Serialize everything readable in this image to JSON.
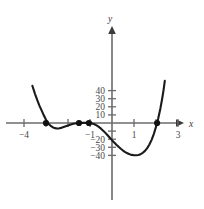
{
  "chart_data": {
    "type": "line",
    "title": "",
    "subtitle": "",
    "xlabel": "x",
    "ylabel": "y",
    "xlim": [
      -4.7,
      3.6
    ],
    "ylim": [
      -44,
      46
    ],
    "grid": false,
    "legend": null,
    "x_ticks": [
      {
        "value": -4,
        "label": "−4"
      },
      {
        "value": -3,
        "label": ""
      },
      {
        "value": -2,
        "label": ""
      },
      {
        "value": -1,
        "label": "−1"
      },
      {
        "value": 1,
        "label": "1"
      },
      {
        "value": 2,
        "label": ""
      },
      {
        "value": 3,
        "label": "3"
      }
    ],
    "y_ticks": [
      {
        "value": 40,
        "label": "40"
      },
      {
        "value": 30,
        "label": "30"
      },
      {
        "value": 20,
        "label": "20"
      },
      {
        "value": 10,
        "label": "10"
      },
      {
        "value": -10,
        "label": ""
      },
      {
        "value": -20,
        "label": "−20"
      },
      {
        "value": -30,
        "label": "−30"
      },
      {
        "value": -40,
        "label": "−40"
      }
    ],
    "series": [
      {
        "name": "quartic",
        "points": [
          [
            -3.62,
            46.0
          ],
          [
            -3.5,
            36.0
          ],
          [
            -3.4,
            28.5
          ],
          [
            -3.3,
            21.5
          ],
          [
            -3.2,
            15.5
          ],
          [
            -3.1,
            9.5
          ],
          [
            -3.0,
            4.0
          ],
          [
            -2.9,
            -0.5
          ],
          [
            -2.8,
            -3.2
          ],
          [
            -2.7,
            -5.2
          ],
          [
            -2.6,
            -6.3
          ],
          [
            -2.5,
            -6.8
          ],
          [
            -2.4,
            -6.6
          ],
          [
            -2.3,
            -6.0
          ],
          [
            -2.2,
            -5.0
          ],
          [
            -2.1,
            -4.0
          ],
          [
            -2.0,
            -3.0
          ],
          [
            -1.9,
            -2.1
          ],
          [
            -1.8,
            -1.3
          ],
          [
            -1.7,
            -0.7
          ],
          [
            -1.6,
            -0.2
          ],
          [
            -1.5,
            0.0
          ],
          [
            -1.4,
            0.1
          ],
          [
            -1.3,
            0.2
          ],
          [
            -1.2,
            0.1
          ],
          [
            -1.1,
            0.05
          ],
          [
            -1.0,
            0.0
          ],
          [
            -0.9,
            -0.6
          ],
          [
            -0.8,
            -1.6
          ],
          [
            -0.7,
            -3.0
          ],
          [
            -0.6,
            -4.8
          ],
          [
            -0.5,
            -7.0
          ],
          [
            -0.4,
            -9.5
          ],
          [
            -0.3,
            -12.2
          ],
          [
            -0.2,
            -15.2
          ],
          [
            -0.1,
            -18.2
          ],
          [
            0.0,
            -21.2
          ],
          [
            0.1,
            -24.0
          ],
          [
            0.2,
            -26.8
          ],
          [
            0.3,
            -29.4
          ],
          [
            0.4,
            -31.8
          ],
          [
            0.5,
            -34.0
          ],
          [
            0.6,
            -35.9
          ],
          [
            0.7,
            -37.4
          ],
          [
            0.8,
            -38.6
          ],
          [
            0.9,
            -39.4
          ],
          [
            1.0,
            -39.8
          ],
          [
            1.1,
            -39.9
          ],
          [
            1.2,
            -39.5
          ],
          [
            1.3,
            -38.5
          ],
          [
            1.4,
            -36.8
          ],
          [
            1.5,
            -34.4
          ],
          [
            1.6,
            -31.0
          ],
          [
            1.7,
            -26.5
          ],
          [
            1.8,
            -20.8
          ],
          [
            1.9,
            -13.6
          ],
          [
            2.0,
            -4.8
          ],
          [
            2.05,
            0.0
          ],
          [
            2.1,
            5.5
          ],
          [
            2.2,
            18.0
          ],
          [
            2.28,
            30.0
          ],
          [
            2.34,
            40.0
          ],
          [
            2.4,
            52.0
          ]
        ]
      }
    ],
    "marked_points": [
      {
        "x": -3.0,
        "y": 0,
        "label": ""
      },
      {
        "x": -1.5,
        "y": 0,
        "label": ""
      },
      {
        "x": -1.05,
        "y": 0,
        "label": ""
      },
      {
        "x": 2.05,
        "y": 0,
        "label": ""
      }
    ],
    "annotations": []
  }
}
